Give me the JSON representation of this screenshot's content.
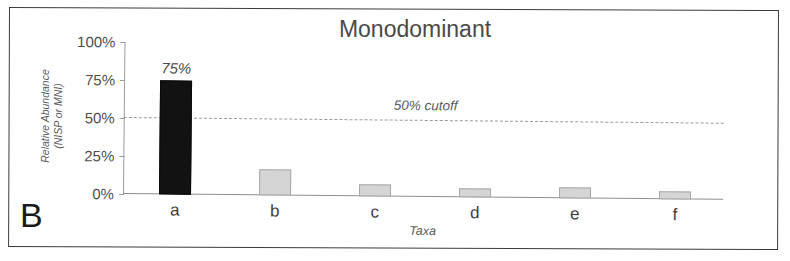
{
  "panel": {
    "label": "B"
  },
  "chart_data": {
    "type": "bar",
    "title": "Monodominant",
    "xlabel": "Taxa",
    "ylabel": "Relative Abundance",
    "ylabel_line2": "(NISP or MNI)",
    "categories": [
      "a",
      "b",
      "c",
      "d",
      "e",
      "f"
    ],
    "values": [
      75,
      17,
      8,
      6,
      7,
      5
    ],
    "value_labels": [
      "75%",
      "",
      "",
      "",
      "",
      ""
    ],
    "bar_styles": [
      "dark",
      "light",
      "light",
      "light",
      "light",
      "light"
    ],
    "colors": {
      "dominant_bar": "#121212",
      "other_bar": "#d5d5d5",
      "other_bar_border": "#a8a8a8",
      "axis": "#8e8e8e",
      "cutoff_line": "#9a9a9a",
      "text": "#4a4a4a",
      "frame": "#3b3b3b"
    },
    "ylim": [
      0,
      100
    ],
    "ytick_values": [
      0,
      25,
      50,
      75,
      100
    ],
    "ytick_labels": [
      "0%",
      "25%",
      "50%",
      "75%",
      "100%"
    ],
    "grid": false,
    "legend": "none",
    "annotations": [
      {
        "name": "cutoff",
        "text": "50% cutoff",
        "y_value": 50,
        "style": "dashed-horizontal-line-with-inline-italic-label"
      }
    ]
  }
}
